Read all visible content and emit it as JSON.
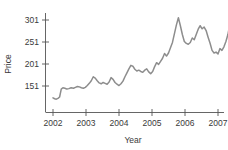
{
  "chart_data": {
    "type": "line",
    "title": "",
    "xlabel": "Year",
    "ylabel": "Price",
    "xlim": [
      2001.85,
      2007.6
    ],
    "ylim": [
      110,
      330
    ],
    "grid": false,
    "legend": null,
    "xticks": [
      2002,
      2003,
      2004,
      2005,
      2006,
      2007
    ],
    "xtick_labels": [
      "2002",
      "2003",
      "2004",
      "2005",
      "2006",
      "2007"
    ],
    "yticks": [
      151,
      201,
      251,
      301
    ],
    "ytick_labels": [
      "151",
      "201",
      "251",
      "301"
    ],
    "series": [
      {
        "name": "Price",
        "color": "#8d8d8d",
        "x": [
          2002.0,
          2002.05,
          2002.1,
          2002.15,
          2002.2,
          2002.25,
          2002.3,
          2002.36,
          2002.42,
          2002.48,
          2002.55,
          2002.62,
          2002.68,
          2002.74,
          2002.8,
          2002.86,
          2002.92,
          2002.98,
          2003.04,
          2003.1,
          2003.16,
          2003.22,
          2003.28,
          2003.34,
          2003.4,
          2003.46,
          2003.52,
          2003.58,
          2003.64,
          2003.7,
          2003.76,
          2003.82,
          2003.88,
          2003.94,
          2004.0,
          2004.06,
          2004.12,
          2004.18,
          2004.24,
          2004.3,
          2004.36,
          2004.42,
          2004.48,
          2004.54,
          2004.6,
          2004.66,
          2004.72,
          2004.78,
          2004.84,
          2004.9,
          2004.96,
          2005.02,
          2005.08,
          2005.14,
          2005.2,
          2005.26,
          2005.32,
          2005.38,
          2005.44,
          2005.5,
          2005.56,
          2005.62,
          2005.68,
          2005.74,
          2005.8,
          2005.86,
          2005.92,
          2005.98,
          2006.04,
          2006.1,
          2006.16,
          2006.22,
          2006.28,
          2006.34,
          2006.4,
          2006.46,
          2006.52,
          2006.58,
          2006.64,
          2006.7,
          2006.76,
          2006.82,
          2006.88,
          2006.94,
          2007.0,
          2007.06,
          2007.12,
          2007.18,
          2007.24,
          2007.3,
          2007.36,
          2007.42
        ],
        "y": [
          124,
          122,
          121,
          123,
          126,
          144,
          147,
          146,
          144,
          145,
          147,
          146,
          148,
          150,
          149,
          147,
          146,
          148,
          152,
          157,
          163,
          172,
          169,
          163,
          158,
          156,
          159,
          157,
          155,
          160,
          170,
          166,
          159,
          155,
          152,
          156,
          162,
          172,
          181,
          190,
          198,
          196,
          189,
          185,
          187,
          184,
          182,
          187,
          190,
          183,
          179,
          184,
          195,
          204,
          200,
          207,
          214,
          225,
          219,
          226,
          238,
          250,
          270,
          290,
          306,
          288,
          268,
          252,
          248,
          246,
          250,
          260,
          256,
          268,
          280,
          288,
          281,
          285,
          277,
          262,
          248,
          232,
          226,
          228,
          224,
          236,
          232,
          240,
          252,
          268,
          292,
          325
        ]
      }
    ]
  },
  "axis": {
    "ylabel": "Price",
    "xlabel": "Year"
  }
}
